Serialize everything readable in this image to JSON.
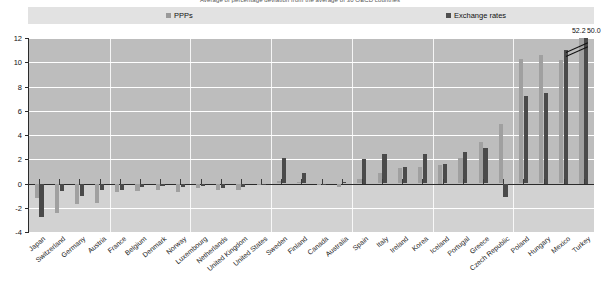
{
  "title": "Average of percentage deviation from the average of 30 OECD countries",
  "legend": {
    "position": "top",
    "items": [
      {
        "label": "PPPs",
        "color": "#9a9a9a",
        "key": "ppps"
      },
      {
        "label": "Exchange rates",
        "color": "#4f4f4f",
        "key": "exchange_rates"
      }
    ]
  },
  "colors": {
    "ppp": "#a0a0a0",
    "fx": "#4a4a4a",
    "plot_bg": "#bdbdbd",
    "plot_bg_below": "#d2d2d2",
    "grid": "#ffffff",
    "axis": "#2b2b2b",
    "legend_band": "#e2e2e2"
  },
  "overflow_labels": [
    {
      "text": "52.2",
      "series": "ppps",
      "category": "Turkey"
    },
    {
      "text": "50.0",
      "series": "exchange_rates",
      "category": "Turkey"
    }
  ],
  "chart_data": {
    "type": "bar",
    "title": "Average of percentage deviation from the average of 30 OECD countries",
    "xlabel": "",
    "ylabel": "",
    "ylim": [
      -4,
      12
    ],
    "yticks": [
      -4,
      -2,
      0,
      2,
      4,
      6,
      8,
      10,
      12
    ],
    "ytick_labels": [
      "-4",
      "-2",
      "0",
      "2",
      "4",
      "6",
      "8",
      "10",
      "12"
    ],
    "grid": true,
    "legend_position": "top",
    "axis_break": true,
    "axis_break_note": "Turkey bars exceed the 12 axis maximum; actual values printed above the break marks.",
    "categories": [
      "Japan",
      "Switzerland",
      "Germany",
      "Austria",
      "France",
      "Belgium",
      "Denmark",
      "Norway",
      "Luxembourg",
      "Netherlands",
      "United Kingdom",
      "United States",
      "Sweden",
      "Finland",
      "Canada",
      "Australia",
      "Spain",
      "Italy",
      "Ireland",
      "Korea",
      "Iceland",
      "Portugal",
      "Greece",
      "Czech Republic",
      "Poland",
      "Hungary",
      "Mexico",
      "Turkey"
    ],
    "series": [
      {
        "name": "PPPs",
        "color": "#a0a0a0",
        "values": [
          -1.2,
          -2.4,
          -1.7,
          -1.6,
          -0.7,
          -0.6,
          -0.5,
          -0.7,
          -0.4,
          -0.5,
          -0.5,
          0.0,
          0.2,
          0.1,
          0.0,
          -0.3,
          0.4,
          0.9,
          1.3,
          1.4,
          1.5,
          2.1,
          3.4,
          4.9,
          10.3,
          10.6,
          10.2,
          52.2
        ]
      },
      {
        "name": "Exchange rates",
        "color": "#4a4a4a",
        "values": [
          -2.8,
          -0.6,
          -1.0,
          -0.5,
          -0.5,
          -0.3,
          -0.2,
          -0.3,
          -0.2,
          -0.4,
          -0.3,
          0.0,
          2.1,
          0.9,
          -0.1,
          0.1,
          2.0,
          2.4,
          1.4,
          2.4,
          1.6,
          2.6,
          2.9,
          -1.1,
          7.2,
          7.5,
          11.0,
          50.0
        ]
      }
    ]
  }
}
